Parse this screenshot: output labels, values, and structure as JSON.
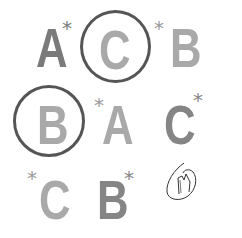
{
  "sheet": {
    "type": "letter-cancellation-task",
    "colors": {
      "dark_letter": "#7a7a7a",
      "light_letter": "#a9a9a9",
      "circle": "#555555",
      "scribble": "#333333"
    },
    "rows": [
      {
        "items": [
          {
            "letter": "A",
            "star": "*",
            "star_position": "after",
            "shade": "dark",
            "circled": false
          },
          {
            "letter": "C",
            "star": "",
            "star_position": "none",
            "shade": "light",
            "circled": true
          },
          {
            "letter": "B",
            "star": "*",
            "star_position": "before",
            "shade": "light",
            "circled": false
          }
        ]
      },
      {
        "items": [
          {
            "letter": "B",
            "star": "",
            "star_position": "none",
            "shade": "light",
            "circled": true
          },
          {
            "letter": "A",
            "star": "*",
            "star_position": "before",
            "shade": "light",
            "circled": false
          },
          {
            "letter": "C",
            "star": "*",
            "star_position": "after",
            "shade": "dark",
            "circled": false
          }
        ]
      },
      {
        "items": [
          {
            "letter": "C",
            "star": "*",
            "star_position": "before",
            "shade": "light",
            "circled": false
          },
          {
            "letter": "B",
            "star": "*",
            "star_position": "after",
            "shade": "dark",
            "circled": false
          },
          {
            "letter": "",
            "star": "",
            "star_position": "none",
            "shade": "none",
            "circled": false,
            "handwritten_mark": "scribble"
          }
        ]
      }
    ]
  }
}
